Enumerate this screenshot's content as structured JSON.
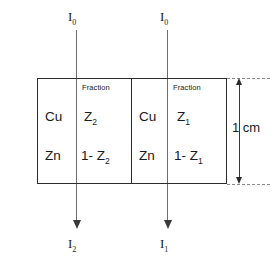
{
  "figure": {
    "type": "diagram",
    "colors": {
      "outline": "#2b2b2b",
      "beam": "#6e6e6e",
      "dimension": "#8a8a8a",
      "background": "#ffffff"
    }
  },
  "panels": [
    {
      "id": "left",
      "incident_label": "I",
      "incident_sub": "0",
      "transmitted_label": "I",
      "transmitted_sub": "2",
      "column_header": "Fraction",
      "rows": [
        {
          "element": "Cu",
          "fraction": "Z",
          "fraction_sub": "2",
          "fraction_full": "Z2"
        },
        {
          "element": "Zn",
          "fraction": "1- Z",
          "fraction_sub": "2",
          "fraction_full": "1- Z2"
        }
      ]
    },
    {
      "id": "right",
      "incident_label": "I",
      "incident_sub": "0",
      "transmitted_label": "I",
      "transmitted_sub": "1",
      "column_header": "Fraction",
      "rows": [
        {
          "element": "Cu",
          "fraction": "Z",
          "fraction_sub": "1",
          "fraction_full": "Z1"
        },
        {
          "element": "Zn",
          "fraction": "1- Z",
          "fraction_sub": "1",
          "fraction_full": "1- Z1"
        }
      ]
    }
  ],
  "dimension": {
    "label": "1 cm",
    "value": 1,
    "unit": "cm",
    "measures": "thickness of right slab"
  }
}
